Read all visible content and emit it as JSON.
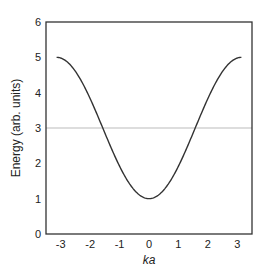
{
  "chart_data": {
    "type": "line",
    "title": "",
    "xlabel": "ka",
    "ylabel": "Energy (arb. units)",
    "xlim": [
      -3.5,
      3.5
    ],
    "ylim": [
      0,
      6
    ],
    "xticks": [
      -3,
      -2,
      -1,
      0,
      1,
      2,
      3
    ],
    "yticks": [
      0,
      1,
      2,
      3,
      4,
      5,
      6
    ],
    "grid": false,
    "legend": null,
    "series": [
      {
        "name": "E(ka) = 3 - 2cos(ka)",
        "color": "#333333",
        "x": [
          -3.14,
          -3.0,
          -2.5,
          -2.0,
          -1.5,
          -1.0,
          -0.5,
          0.0,
          0.5,
          1.0,
          1.5,
          2.0,
          2.5,
          3.0,
          3.14
        ],
        "y": [
          5.0,
          4.98,
          4.6,
          3.83,
          2.86,
          1.92,
          1.24,
          1.0,
          1.24,
          1.92,
          2.86,
          3.83,
          4.6,
          4.98,
          5.0
        ]
      }
    ],
    "annotations": [
      {
        "type": "hline",
        "y": 3,
        "color": "#bbbbbb"
      }
    ]
  }
}
